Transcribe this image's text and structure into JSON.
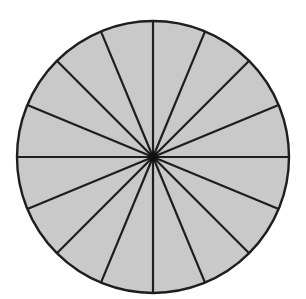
{
  "diagram": {
    "type": "divided-circle",
    "sectors": 16,
    "center": [
      153,
      157
    ],
    "radius": 136,
    "colors": {
      "background": "#ffffff",
      "fill": "#c9c9c9",
      "stroke": "#1e1e1e",
      "hub": "#111111"
    },
    "stroke_width": 2.2,
    "outline_width": 2.4,
    "hub_radius": 4.5
  }
}
